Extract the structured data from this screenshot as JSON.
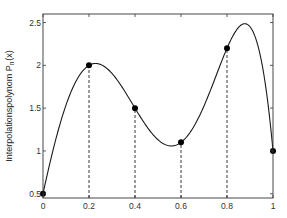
{
  "chart_data": {
    "type": "line",
    "title": "",
    "xlabel": "",
    "ylabel": "Interpolationspolynom P_n(x)",
    "ylabel_main": "Interpolationspolynom P",
    "ylabel_sub": "n",
    "ylabel_tail": "(x)",
    "xlim": [
      0,
      1
    ],
    "ylim": [
      0.45,
      2.6
    ],
    "grid": false,
    "legend": null,
    "x_ticks": [
      0,
      0.2,
      0.4,
      0.6,
      0.8,
      1
    ],
    "x_tick_labels": [
      "0",
      "0.2",
      "0.4",
      "0.6",
      "0.8",
      "1"
    ],
    "y_ticks": [
      0.5,
      1,
      1.5,
      2,
      2.5
    ],
    "y_tick_labels": [
      "0.5",
      "1",
      "1.5",
      "2",
      "2.5"
    ],
    "series": [
      {
        "name": "interpolation nodes",
        "style": "markers",
        "x": [
          0,
          0.2,
          0.4,
          0.6,
          0.8,
          1
        ],
        "y": [
          0.5,
          2.0,
          1.5,
          1.1,
          2.2,
          1.0
        ]
      },
      {
        "name": "Interpolationspolynom P_n(x)",
        "style": "solid line",
        "note": "degree-5 polynomial through the nodes; max ≈ 2.48 at x ≈ 0.88, local min ≈ 1.05 at x ≈ 0.56"
      }
    ],
    "annotations": [
      "dashed vertical lines from x-axis to each node at x = 0.2, 0.4, 0.6, 0.8"
    ]
  },
  "colors": {
    "line": "#1a1a1a",
    "marker": "#000000",
    "axes": "#333333",
    "background": "#ffffff"
  }
}
